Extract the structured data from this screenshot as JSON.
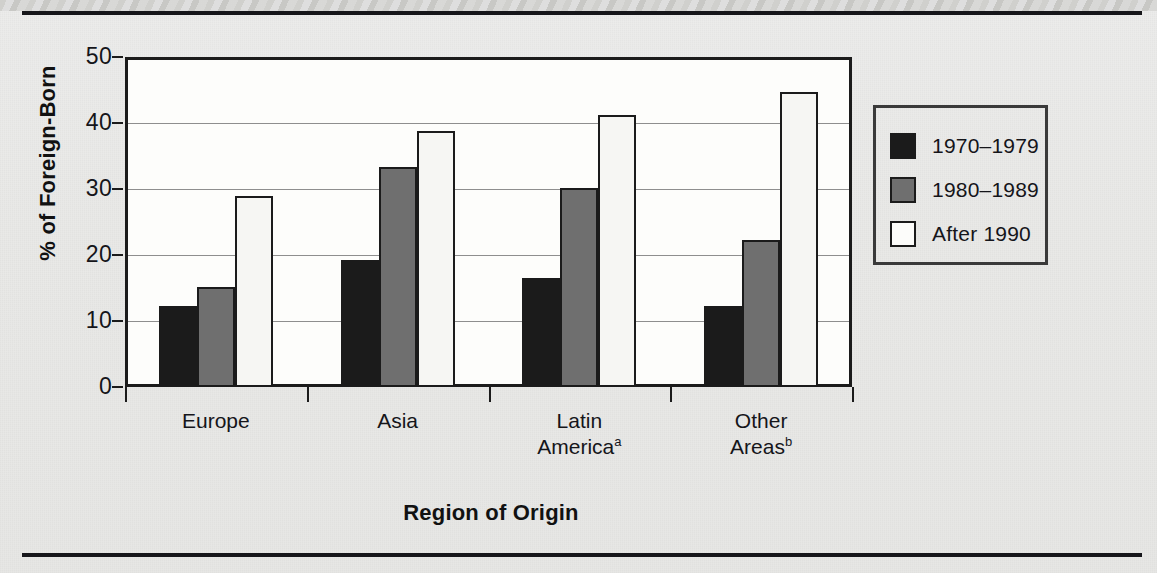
{
  "figure": {
    "background_color": "#e9e9e7",
    "plot_background_color": "#fdfdfb",
    "frame_color": "#1b1b1b"
  },
  "chart_data": {
    "type": "bar",
    "title": "",
    "xlabel": "Region of Origin",
    "ylabel": "% of Foreign-Born",
    "categories": [
      "Europe",
      "Asia",
      "Latin America",
      "Other Areas"
    ],
    "category_labels": [
      {
        "line1": "Europe",
        "line2": "",
        "footnote": ""
      },
      {
        "line1": "Asia",
        "line2": "",
        "footnote": ""
      },
      {
        "line1": "Latin",
        "line2": "America",
        "footnote": "a"
      },
      {
        "line1": "Other",
        "line2": "Areas",
        "footnote": "b"
      }
    ],
    "series": [
      {
        "name": "1970-1979",
        "color": "#1b1b1b",
        "values": [
          12.3,
          19.3,
          16.5,
          12.3
        ]
      },
      {
        "name": "1980-1989",
        "color": "#6f6f6f",
        "values": [
          15.1,
          33.4,
          30.1,
          22.3
        ]
      },
      {
        "name": "After 1990",
        "color": "#f6f6f3",
        "values": [
          29.0,
          38.8,
          41.2,
          44.7
        ]
      }
    ],
    "ylim": [
      0,
      50
    ],
    "yticks": [
      0,
      10,
      20,
      30,
      40,
      50
    ],
    "ytick_labels": [
      "0",
      "10",
      "20",
      "30",
      "40",
      "50"
    ],
    "grid": true,
    "legend_position": "right",
    "legend_entries": [
      "1970–1979",
      "1980–1989",
      "After 1990"
    ]
  },
  "legend": {
    "items": [
      {
        "label": "1970–1979",
        "swatch": "black-swatch"
      },
      {
        "label": "1980–1989",
        "swatch": "gray-swatch"
      },
      {
        "label": "After 1990",
        "swatch": "white-swatch"
      }
    ]
  },
  "axis": {
    "y_title": "% of Foreign-Born",
    "x_title": "Region of Origin"
  }
}
